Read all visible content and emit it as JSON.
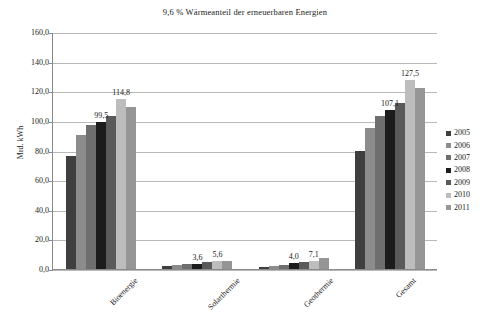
{
  "chart_data": {
    "type": "bar",
    "title": "9,6 % Wärmeanteil der erneuerbaren Energien",
    "xlabel": "",
    "ylabel": "Mrd. kWh",
    "ylim": [
      0,
      160
    ],
    "ytick_step": 20,
    "ytick_labels": [
      "0,0",
      "20,0",
      "40,0",
      "60,0",
      "80,0",
      "100,0",
      "120,0",
      "140,0",
      "160,0"
    ],
    "grid": true,
    "legend_position": "right",
    "categories": [
      "Bioenergie",
      "Solarthermie",
      "Geothermie",
      "Gesamt"
    ],
    "series": [
      {
        "name": "2005",
        "color": "#3f3f3f",
        "values": [
          76.6,
          2.2,
          1.2,
          80.0
        ]
      },
      {
        "name": "2006",
        "color": "#8c8c8c",
        "values": [
          90.4,
          2.7,
          2.0,
          95.1
        ]
      },
      {
        "name": "2007",
        "color": "#6e6e6e",
        "values": [
          97.3,
          3.1,
          2.9,
          103.3
        ]
      },
      {
        "name": "2008",
        "color": "#1c1c1c",
        "values": [
          99.5,
          3.6,
          4.0,
          107.1
        ]
      },
      {
        "name": "2009",
        "color": "#5a5a5a",
        "values": [
          103.2,
          4.4,
          4.8,
          112.4
        ]
      },
      {
        "name": "2010",
        "color": "#bdbdbd",
        "values": [
          114.8,
          5.2,
          5.6,
          127.5
        ]
      },
      {
        "name": "2011",
        "color": "#969696",
        "values": [
          109.6,
          5.6,
          7.1,
          122.3
        ]
      }
    ],
    "data_labels": [
      {
        "text": "99,5",
        "category": "Bioenergie",
        "series": "2008"
      },
      {
        "text": "114,8",
        "category": "Bioenergie",
        "series": "2010"
      },
      {
        "text": "3,6",
        "category": "Solarthermie",
        "series": "2008"
      },
      {
        "text": "5,6",
        "category": "Solarthermie",
        "series": "2010"
      },
      {
        "text": "4,0",
        "category": "Geothermie",
        "series": "2008"
      },
      {
        "text": "7,1",
        "category": "Geothermie",
        "series": "2010"
      },
      {
        "text": "107,1",
        "category": "Gesamt",
        "series": "2008"
      },
      {
        "text": "127,5",
        "category": "Gesamt",
        "series": "2010"
      }
    ]
  },
  "legend": {
    "items": [
      "2005",
      "2006",
      "2007",
      "2008",
      "2009",
      "2010",
      "2011"
    ]
  },
  "colors": {
    "gridline": "#b9b9b9",
    "axis": "#8a8a8a",
    "text": "#1a1a1a",
    "background": "#ffffff"
  }
}
